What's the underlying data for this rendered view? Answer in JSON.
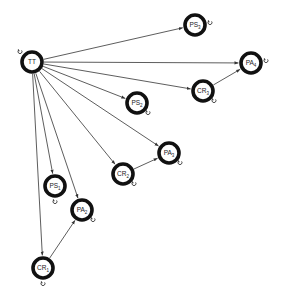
{
  "diagram": {
    "type": "directed-graph",
    "colors": {
      "edge": "#333333",
      "node_ring": "#111111",
      "node_fill": "#ffffff",
      "label": "#222222"
    },
    "nodes": [
      {
        "id": "TT",
        "base": "TT",
        "sub": "",
        "x": 32,
        "y": 62,
        "loop": "top-left"
      },
      {
        "id": "PS3",
        "base": "PS",
        "sub": "3",
        "x": 195,
        "y": 25,
        "loop": "right"
      },
      {
        "id": "PA4",
        "base": "PA",
        "sub": "4",
        "x": 251,
        "y": 63,
        "loop": "right"
      },
      {
        "id": "CR3",
        "base": "CR",
        "sub": "3",
        "x": 203,
        "y": 91,
        "loop": "bottom-right"
      },
      {
        "id": "PS2",
        "base": "PS",
        "sub": "2",
        "x": 137,
        "y": 103,
        "loop": "bottom-right"
      },
      {
        "id": "PA3",
        "base": "PA",
        "sub": "3",
        "x": 169,
        "y": 153,
        "loop": "bottom-right"
      },
      {
        "id": "CR2",
        "base": "CR",
        "sub": "2",
        "x": 123,
        "y": 174,
        "loop": "bottom-right"
      },
      {
        "id": "PS1",
        "base": "PS",
        "sub": "1",
        "x": 55,
        "y": 186,
        "loop": "bottom"
      },
      {
        "id": "PA2",
        "base": "PA",
        "sub": "2",
        "x": 82,
        "y": 210,
        "loop": "bottom-right"
      },
      {
        "id": "CR1",
        "base": "CR",
        "sub": "1",
        "x": 43,
        "y": 268,
        "loop": "bottom"
      }
    ],
    "edges": [
      {
        "from": "TT",
        "to": "PS3"
      },
      {
        "from": "TT",
        "to": "PA4"
      },
      {
        "from": "TT",
        "to": "CR3"
      },
      {
        "from": "TT",
        "to": "PS2"
      },
      {
        "from": "TT",
        "to": "PA3"
      },
      {
        "from": "TT",
        "to": "CR2"
      },
      {
        "from": "TT",
        "to": "PS1"
      },
      {
        "from": "TT",
        "to": "PA2"
      },
      {
        "from": "TT",
        "to": "CR1"
      },
      {
        "from": "CR3",
        "to": "PA4"
      },
      {
        "from": "CR2",
        "to": "PA3"
      },
      {
        "from": "CR1",
        "to": "PA2"
      }
    ]
  }
}
